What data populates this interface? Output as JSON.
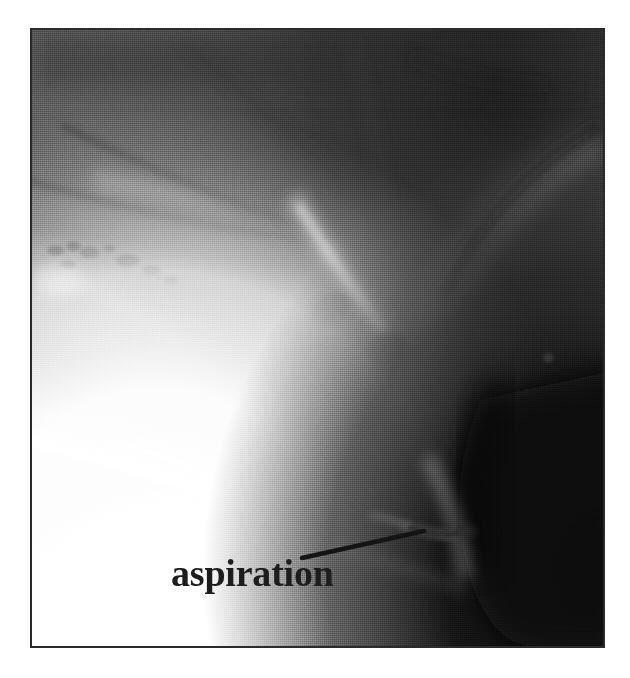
{
  "figure": {
    "kind": "radiograph",
    "modality": "videofluoroscopic-swallow-study",
    "view": "lateral",
    "background_color": "#ffffff",
    "frame": {
      "border_color": "#2b2b2b",
      "x": 30,
      "y": 28,
      "width": 575,
      "height": 620
    }
  },
  "annotations": {
    "aspiration": {
      "label": "aspiration",
      "text_color": "#1d1d1d",
      "leader_line": {
        "color": "#141414",
        "x1": 302,
        "y1": 558,
        "x2": 424,
        "y2": 531
      }
    }
  },
  "image_regions": {
    "soft_tissue_upper": {
      "name": "soft-tissue-upper",
      "tone": "#555555"
    },
    "cervical_spine": {
      "name": "cervical-spine-shadow",
      "tone": "#2e2e2e"
    },
    "mandible": {
      "name": "mandible",
      "tone": "#8e8e8e"
    },
    "dental_shadows": {
      "name": "dental-shadows",
      "tone": "#171717"
    },
    "barium_bolus": {
      "name": "barium-bolus",
      "tone": "#ffffff"
    },
    "epiglottis_streak": {
      "name": "epiglottis-streak",
      "tone": "#b9b9b9"
    },
    "hyoid_shadow": {
      "name": "hyoid-shadow",
      "tone": "#3a3a3a"
    },
    "airway_column": {
      "name": "airway-column",
      "tone": "#1a1a1a"
    },
    "aspirate_streak": {
      "name": "aspirate-streak",
      "tone": "#5a5a5a"
    },
    "posterior_dark_field": {
      "name": "posterior-dark-field",
      "tone": "#111111"
    }
  }
}
